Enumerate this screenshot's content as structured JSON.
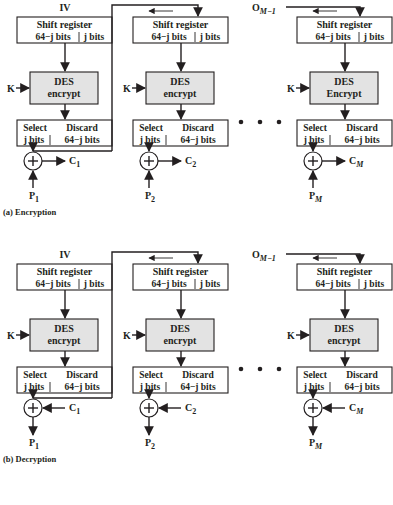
{
  "encryption": {
    "caption": "(a) Encryption",
    "input_label": "IV",
    "last_input_label": "O",
    "last_input_sub": "M−1",
    "key_label": "K",
    "shift_register": {
      "title": "Shift register",
      "left": "64−j bits",
      "right": "j bits"
    },
    "des": {
      "title": "DES",
      "columns": [
        "encrypt",
        "encrypt",
        "Encrypt"
      ]
    },
    "select_discard": {
      "select": "Select",
      "select_bits": "j bits",
      "discard": "Discard",
      "discard_bits": "64−j bits"
    },
    "stages": [
      {
        "out": "C",
        "out_sub": "1",
        "in": "P",
        "in_sub": "1"
      },
      {
        "out": "C",
        "out_sub": "2",
        "in": "P",
        "in_sub": "2"
      },
      {
        "out": "C",
        "out_sub": "M",
        "in": "P",
        "in_sub": "M"
      }
    ],
    "xor_symbol": "+",
    "ellipsis": "• • •"
  },
  "decryption": {
    "caption": "(b) Decryption",
    "input_label": "IV",
    "last_input_label": "O",
    "last_input_sub": "M−1",
    "key_label": "K",
    "shift_register": {
      "title": "Shift register",
      "left": "64−j bits",
      "right": "j bits"
    },
    "des": {
      "title": "DES",
      "columns": [
        "encrypt",
        "encrypt",
        "encrypt"
      ]
    },
    "select_discard": {
      "select": "Select",
      "select_bits": "j bits",
      "discard": "Discard",
      "discard_bits": "64−j bits"
    },
    "stages": [
      {
        "in": "C",
        "in_sub": "1",
        "out": "P",
        "out_sub": "1"
      },
      {
        "in": "C",
        "in_sub": "2",
        "out": "P",
        "out_sub": "2"
      },
      {
        "in": "C",
        "in_sub": "M",
        "out": "P",
        "out_sub": "M"
      }
    ],
    "xor_symbol": "+",
    "ellipsis": "• • •"
  }
}
